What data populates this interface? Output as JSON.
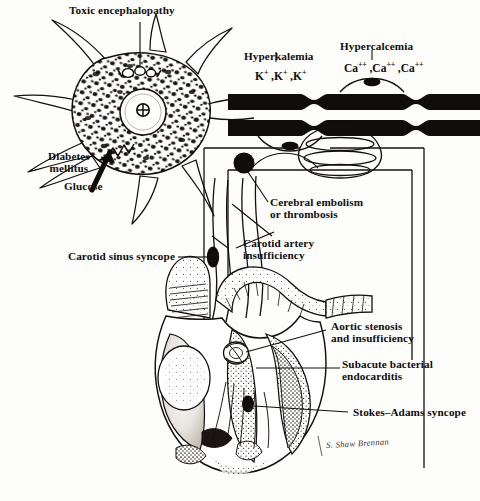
{
  "figure": {
    "type": "medical-illustration",
    "background_color": "#fdfdfb",
    "ink_color": "#100d0c"
  },
  "labels": {
    "toxic_encephalopathy": "Toxic encephalopathy",
    "diabetes_mellitus": "Diabetes\nmellitus",
    "glucose": "Glucose",
    "hyperkalemia": "Hyperkalemia",
    "hypercalcemia": "Hypercalcemia",
    "cerebral_embolism": "Cerebral embolism\nor thrombosis",
    "carotid_artery_insufficiency": "Carotid artery\ninsufficiency",
    "carotid_sinus_syncope": "Carotid sinus syncope",
    "aortic_stenosis": "Aortic stenosis\nand insufficiency",
    "subacute_bacterial_endocarditis": "Subacute bacterial\nendocarditis",
    "stokes_adams_syncope": "Stokes–Adams syncope"
  },
  "ions": {
    "potassium_series": [
      "K",
      "K",
      "K"
    ],
    "potassium_charge": "+",
    "calcium_series": [
      "Ca",
      "Ca",
      "Ca"
    ],
    "calcium_charge": "++",
    "potassium_text": "K+ , K+ , K+",
    "calcium_text": "Ca++ , Ca++ , Ca++"
  },
  "signature": {
    "artist": "S. Shaw Brennan"
  },
  "structures": {
    "neuron": "neuron-cell-body",
    "nucleus": "nucleus",
    "nucleolus": "nucleolus",
    "nissl": "nissl-substance",
    "axon": "myelinated-axon",
    "node_of_ranvier": "node-of-ranvier",
    "brain": "brain-schematic",
    "carotid": "carotid-artery",
    "heart": "heart-cross-section",
    "aortic_valve": "aortic-valve",
    "conduction": "conduction-system"
  }
}
